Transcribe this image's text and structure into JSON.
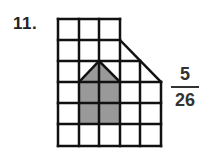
{
  "problem": {
    "number": "11.",
    "answer": {
      "numerator": "5",
      "denominator": "26"
    }
  },
  "figure": {
    "grid_cols": 5,
    "grid_rows": 6,
    "shaded_color": "#999999",
    "line_color": "#111111"
  }
}
